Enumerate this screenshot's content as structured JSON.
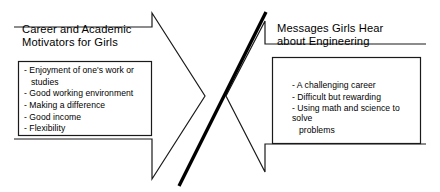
{
  "diagram": {
    "type": "two-opposing-block-arrows",
    "divider": {
      "name": "diagonal-divider-line",
      "color": "#000000",
      "thickness_px": 3
    },
    "stroke_color": "#1a1a1a",
    "fill_color": "#ffffff",
    "left_panel": {
      "title": "Career and Academic\nMotivators for Girls",
      "bullets": [
        {
          "text": "- Enjoyment of one's work or",
          "continuation": false
        },
        {
          "text": "studies",
          "continuation": true
        },
        {
          "text": "- Good working environment",
          "continuation": false
        },
        {
          "text": "- Making a difference",
          "continuation": false
        },
        {
          "text": "- Good income",
          "continuation": false
        },
        {
          "text": "- Flexibility",
          "continuation": false
        }
      ],
      "arrow_direction": "right"
    },
    "right_panel": {
      "title": "Messages Girls Hear\nabout Engineering",
      "bullets": [
        {
          "text": "- A challenging career",
          "continuation": false
        },
        {
          "text": "- Difficult but rewarding",
          "continuation": false
        },
        {
          "text": "- Using math and science to solve",
          "continuation": false
        },
        {
          "text": "problems",
          "continuation": true
        }
      ],
      "arrow_direction": "left"
    }
  }
}
